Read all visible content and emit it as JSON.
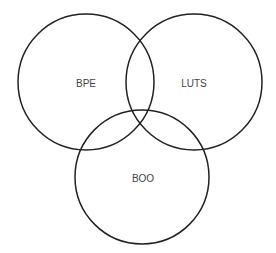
{
  "diagram": {
    "type": "venn",
    "sets": [
      {
        "id": "bpe",
        "label": "BPE",
        "cx": 86,
        "cy": 82,
        "r": 68
      },
      {
        "id": "luts",
        "label": "LUTS",
        "cx": 194,
        "cy": 82,
        "r": 68
      },
      {
        "id": "boo",
        "label": "BOO",
        "cx": 142,
        "cy": 177,
        "r": 68
      }
    ],
    "colors": {
      "stroke": "#222222",
      "label": "#444444",
      "background": "#ffffff"
    }
  }
}
